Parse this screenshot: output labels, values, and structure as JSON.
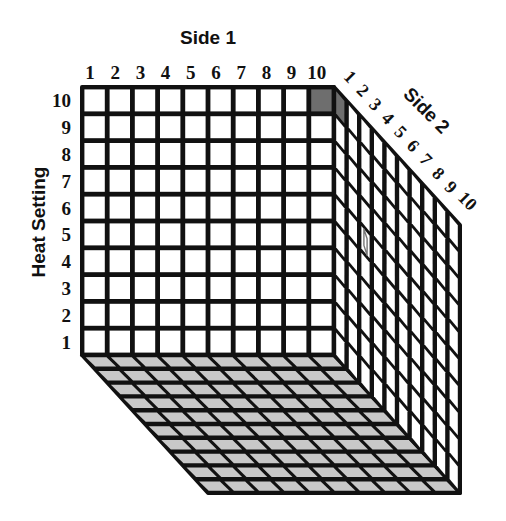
{
  "diagram": {
    "axes": {
      "side1": {
        "label": "Side 1",
        "ticks": [
          "1",
          "2",
          "3",
          "4",
          "5",
          "6",
          "7",
          "8",
          "9",
          "10"
        ]
      },
      "side2": {
        "label": "Side 2",
        "ticks": [
          "1",
          "2",
          "3",
          "4",
          "5",
          "6",
          "7",
          "8",
          "9",
          "10"
        ]
      },
      "heat": {
        "label": "Heat Setting",
        "ticks": [
          "10",
          "9",
          "8",
          "7",
          "6",
          "5",
          "4",
          "3",
          "2",
          "1"
        ]
      }
    },
    "grid": {
      "rows": 10,
      "cols": 10,
      "depth": 10
    },
    "colors": {
      "line": "#111111",
      "front_face": "#ffffff",
      "side_face": "#ffffff",
      "bottom_face": "#c8c8c8",
      "highlight": "#6e6e6e",
      "highlight_outline": "#777777",
      "background": "#ffffff"
    },
    "highlighted_cells": [
      {
        "face": "front",
        "side1": 10,
        "heat": 10,
        "style": "filled"
      },
      {
        "face": "right",
        "side2": 1,
        "heat": 10,
        "style": "filled"
      },
      {
        "face": "right",
        "side2": 3,
        "heat": 6,
        "style": "outlined"
      }
    ]
  }
}
